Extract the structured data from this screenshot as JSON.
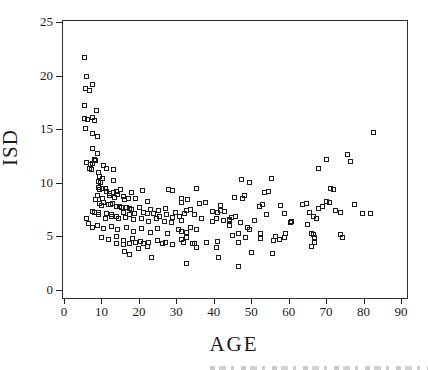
{
  "chart_data": {
    "type": "scatter",
    "title": "",
    "xlabel": "AGE",
    "ylabel": "ISD",
    "xlim": [
      0,
      90
    ],
    "ylim": [
      0,
      25
    ],
    "x_ticks": [
      0,
      10,
      20,
      30,
      40,
      50,
      60,
      70,
      80,
      90
    ],
    "y_ticks": [
      0,
      5,
      10,
      15,
      20,
      25
    ],
    "grid": false,
    "legend": "none",
    "marker": "open-square",
    "marker_color": "#1c1c1c",
    "points": [
      [
        5.5,
        21.7
      ],
      [
        6,
        19.9
      ],
      [
        7.6,
        19.2
      ],
      [
        5.8,
        18.8
      ],
      [
        6.9,
        18.6
      ],
      [
        5.5,
        17.2
      ],
      [
        8.6,
        16.7
      ],
      [
        5.6,
        16
      ],
      [
        6.2,
        15.9
      ],
      [
        7.7,
        16.1
      ],
      [
        8.1,
        15.8
      ],
      [
        5.8,
        15.1
      ],
      [
        7.6,
        14.6
      ],
      [
        8.9,
        14.3
      ],
      [
        7.6,
        13.2
      ],
      [
        8.9,
        12.7
      ],
      [
        8.2,
        12.2
      ],
      [
        6.1,
        11.9
      ],
      [
        7,
        11.7
      ],
      [
        7.7,
        11.8
      ],
      [
        8.5,
        12.1
      ],
      [
        6.7,
        11.3
      ],
      [
        7.4,
        11.2
      ],
      [
        9.3,
        11
      ],
      [
        10.6,
        11.6
      ],
      [
        11.4,
        11.3
      ],
      [
        13.1,
        11.2
      ],
      [
        9.5,
        10.6
      ],
      [
        10.2,
        10.4
      ],
      [
        9.1,
        10.1
      ],
      [
        9.7,
        10
      ],
      [
        13.3,
        10.2
      ],
      [
        9.3,
        9.6
      ],
      [
        10.4,
        9.5
      ],
      [
        9.6,
        9.4
      ],
      [
        11.2,
        9.5
      ],
      [
        14.1,
        9.2
      ],
      [
        15,
        9.4
      ],
      [
        17.9,
        9.1
      ],
      [
        21,
        9.3
      ],
      [
        27.9,
        9.4
      ],
      [
        28.9,
        9.3
      ],
      [
        11.3,
        9.2
      ],
      [
        12.2,
        9
      ],
      [
        13.3,
        9.1
      ],
      [
        14.2,
        8.9
      ],
      [
        15.8,
        8.7
      ],
      [
        17.2,
        8.5
      ],
      [
        31.3,
        8.5
      ],
      [
        9,
        8.8
      ],
      [
        10.3,
        8.5
      ],
      [
        12.1,
        8.8
      ],
      [
        13.4,
        8.6
      ],
      [
        16.1,
        8.4
      ],
      [
        19.2,
        8.5
      ],
      [
        22.4,
        8.3
      ],
      [
        8.5,
        8.4
      ],
      [
        9.5,
        8.1
      ],
      [
        10.6,
        8.2
      ],
      [
        11.8,
        8
      ],
      [
        12.9,
        8.1
      ],
      [
        12.3,
        8
      ],
      [
        9.9,
        7.9
      ],
      [
        14,
        7.8
      ],
      [
        15.3,
        7.7
      ],
      [
        16.6,
        7.7
      ],
      [
        18,
        7.5
      ],
      [
        14.8,
        7.8
      ],
      [
        17.4,
        7.6
      ],
      [
        20.1,
        7.7
      ],
      [
        23.2,
        7.5
      ],
      [
        25.3,
        7.4
      ],
      [
        27.2,
        7.6
      ],
      [
        29.9,
        7.2
      ],
      [
        32.6,
        7.4
      ],
      [
        7.7,
        7.3
      ],
      [
        8.2,
        7.2
      ],
      [
        9.1,
        7.2
      ],
      [
        9.3,
        7
      ],
      [
        11.3,
        7.1
      ],
      [
        12.6,
        7
      ],
      [
        14,
        6.9
      ],
      [
        15.8,
        7.2
      ],
      [
        17.5,
        7
      ],
      [
        18.9,
        7.1
      ],
      [
        21.1,
        7.2
      ],
      [
        22.4,
        7.1
      ],
      [
        23.8,
        7.1
      ],
      [
        25.6,
        6.9
      ],
      [
        27.3,
        7
      ],
      [
        29.1,
        6.8
      ],
      [
        30.9,
        6.9
      ],
      [
        11,
        6.7
      ],
      [
        12.8,
        6.9
      ],
      [
        14.6,
        6.7
      ],
      [
        16.4,
        6.8
      ],
      [
        18.5,
        6.6
      ],
      [
        20.6,
        6.7
      ],
      [
        22.6,
        6.4
      ],
      [
        24.6,
        6.7
      ],
      [
        26.8,
        6.4
      ],
      [
        28.8,
        6.3
      ],
      [
        31.5,
        6.5
      ],
      [
        9,
        6
      ],
      [
        10.5,
        5.7
      ],
      [
        12.6,
        5.9
      ],
      [
        14.3,
        5.6
      ],
      [
        16.6,
        5.8
      ],
      [
        18.5,
        5.5
      ],
      [
        20.8,
        5.7
      ],
      [
        23,
        5.4
      ],
      [
        25,
        5.7
      ],
      [
        27.7,
        5.3
      ],
      [
        30.6,
        5.6
      ],
      [
        32.8,
        5.4
      ],
      [
        6.5,
        6.2
      ],
      [
        5.9,
        6.7
      ],
      [
        7.7,
        5.8
      ],
      [
        9.9,
        4.9
      ],
      [
        11.9,
        4.7
      ],
      [
        13.9,
        5
      ],
      [
        15.8,
        4.6
      ],
      [
        18.2,
        4.8
      ],
      [
        20.3,
        4.5
      ],
      [
        22.6,
        4.4
      ],
      [
        25,
        4.6
      ],
      [
        27.2,
        4.4
      ],
      [
        14,
        4.3
      ],
      [
        15.8,
        4.2
      ],
      [
        17.4,
        4.3
      ],
      [
        19.1,
        4.4
      ],
      [
        21.1,
        4.3
      ],
      [
        22.4,
        4.1
      ],
      [
        26.4,
        4.3
      ],
      [
        29.1,
        4.2
      ],
      [
        31.8,
        4.4
      ],
      [
        34.9,
        4.3
      ],
      [
        38,
        4.4
      ],
      [
        40.7,
        4
      ],
      [
        19.9,
        3.9
      ],
      [
        16.2,
        3.6
      ],
      [
        17.5,
        3.3
      ],
      [
        23.3,
        3
      ],
      [
        32.7,
        2.5
      ],
      [
        41.2,
        3
      ],
      [
        46.5,
        2.2
      ],
      [
        35.3,
        9.5
      ],
      [
        32.9,
        8.4
      ],
      [
        31.3,
        8.2
      ],
      [
        36.1,
        8.1
      ],
      [
        37.9,
        8.2
      ],
      [
        41.9,
        7.9
      ],
      [
        33.7,
        7.5
      ],
      [
        32.1,
        7.1
      ],
      [
        34.8,
        7
      ],
      [
        39.7,
        7.3
      ],
      [
        40.9,
        7.2
      ],
      [
        41.7,
        7.4
      ],
      [
        42.8,
        7.3
      ],
      [
        40.6,
        6.7
      ],
      [
        39.7,
        6.4
      ],
      [
        42.6,
        6.5
      ],
      [
        44.2,
        6.6
      ],
      [
        36.8,
        6.7
      ],
      [
        33.9,
        5.8
      ],
      [
        35.3,
        5.6
      ],
      [
        31.3,
        5.5
      ],
      [
        32.6,
        4.9
      ],
      [
        31.3,
        4.7
      ],
      [
        34.4,
        4.3
      ],
      [
        35.5,
        4
      ],
      [
        40.9,
        4.5
      ],
      [
        45.5,
        8.6
      ],
      [
        47.7,
        8.5
      ],
      [
        47.3,
        10.3
      ],
      [
        49.5,
        10
      ],
      [
        55.3,
        10.4
      ],
      [
        53.5,
        9.1
      ],
      [
        54.6,
        9.2
      ],
      [
        48.1,
        8.8
      ],
      [
        52.3,
        7.8
      ],
      [
        53,
        8
      ],
      [
        57.9,
        7.9
      ],
      [
        44.8,
        6.8
      ],
      [
        45.7,
        6.9
      ],
      [
        44.1,
        6.5
      ],
      [
        47.2,
        6.3
      ],
      [
        51,
        6.5
      ],
      [
        54,
        7
      ],
      [
        58.8,
        7.1
      ],
      [
        60.8,
        6.4
      ],
      [
        44.1,
        6
      ],
      [
        45.1,
        5.1
      ],
      [
        46.7,
        5.3
      ],
      [
        49,
        5.8
      ],
      [
        49.6,
        5.6
      ],
      [
        52.5,
        5.3
      ],
      [
        56.5,
        5
      ],
      [
        59.2,
        5.3
      ],
      [
        46.7,
        4.4
      ],
      [
        48.4,
        4.9
      ],
      [
        52.6,
        4.8
      ],
      [
        55.9,
        4.6
      ],
      [
        57.5,
        4.7
      ],
      [
        58.8,
        4.9
      ],
      [
        50.2,
        3.5
      ],
      [
        55.6,
        3.4
      ],
      [
        60.6,
        6.3
      ],
      [
        63.8,
        8
      ],
      [
        64.7,
        8.1
      ],
      [
        65.6,
        7.2
      ],
      [
        66.5,
        6.9
      ],
      [
        67.3,
        6.7
      ],
      [
        67.9,
        7.6
      ],
      [
        65.1,
        6.1
      ],
      [
        66.2,
        5.3
      ],
      [
        66.7,
        5.2
      ],
      [
        67,
        4.9
      ],
      [
        66.2,
        4.1
      ],
      [
        66.9,
        4.4
      ],
      [
        69.1,
        7.8
      ],
      [
        70.2,
        8.3
      ],
      [
        70.9,
        8.2
      ],
      [
        72.6,
        7.4
      ],
      [
        73.8,
        7.2
      ],
      [
        73.8,
        5.2
      ],
      [
        74.3,
        4.9
      ],
      [
        77.7,
        8
      ],
      [
        79.8,
        7.1
      ],
      [
        81.8,
        7.1
      ],
      [
        67.9,
        11.3
      ],
      [
        70,
        12.2
      ],
      [
        75.6,
        12.6
      ],
      [
        76.5,
        12
      ],
      [
        71.3,
        9.5
      ],
      [
        72,
        9.4
      ],
      [
        82.6,
        14.7
      ]
    ]
  }
}
